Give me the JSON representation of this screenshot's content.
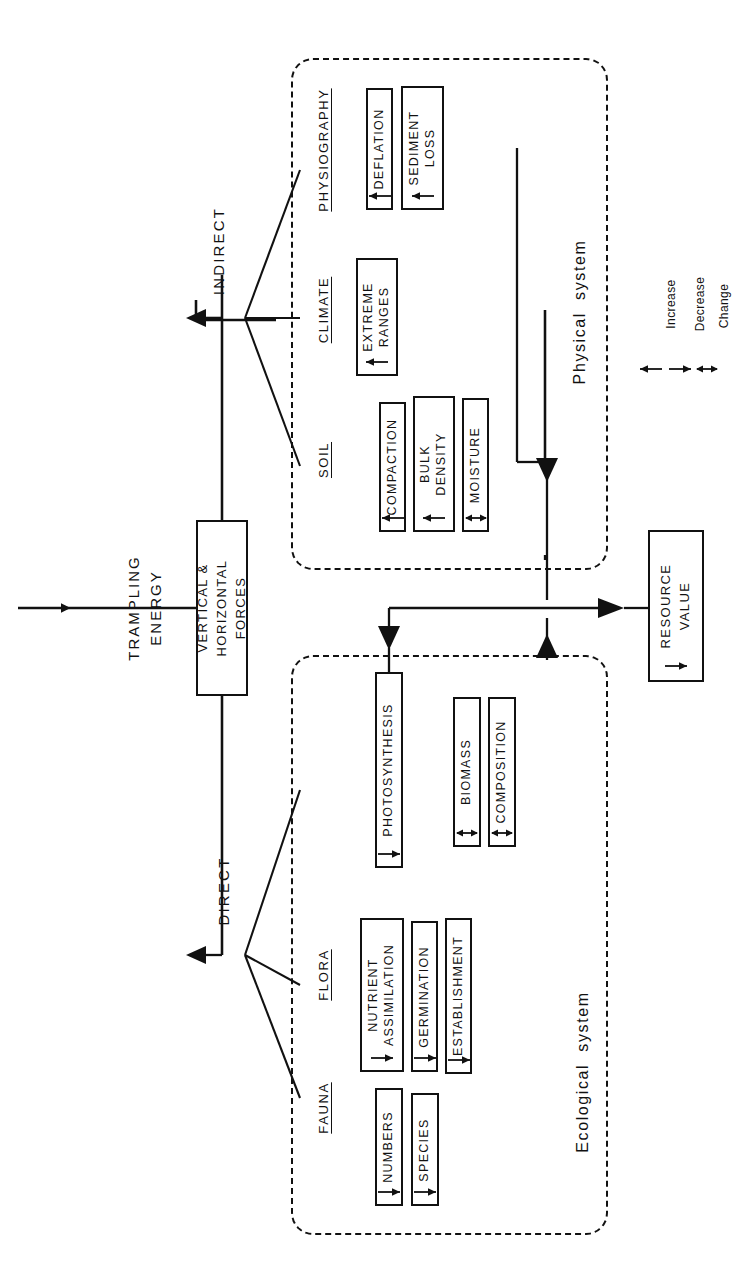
{
  "diagram": {
    "orientation": "rotated-90-ccw",
    "title": "TRAMPLING\nENERGY",
    "input_arrow": "input-arrow",
    "driver_box": {
      "label": "VERTICAL &\nHORIZONTAL\nFORCES"
    },
    "outcome_box": {
      "label": "RESOURCE\nVALUE",
      "effect": "decrease"
    },
    "branches": [
      {
        "name": "INDIRECT"
      },
      {
        "name": "DIRECT"
      }
    ],
    "systems": [
      {
        "id": "physical",
        "label": "Physical  system"
      },
      {
        "id": "ecological",
        "label": "Ecological  system"
      }
    ],
    "categories": [
      {
        "id": "soil",
        "label": "SOIL"
      },
      {
        "id": "climate",
        "label": "CLIMATE"
      },
      {
        "id": "physiography",
        "label": "PHYSIOGRAPHY"
      },
      {
        "id": "fauna",
        "label": "FAUNA"
      },
      {
        "id": "flora",
        "label": "FLORA"
      }
    ],
    "variables": [
      {
        "id": "compaction",
        "label": "COMPACTION",
        "category": "soil",
        "system": "physical",
        "effect": "increase"
      },
      {
        "id": "bulk-density",
        "label": "BULK\nDENSITY",
        "category": "soil",
        "system": "physical",
        "effect": "increase"
      },
      {
        "id": "moisture",
        "label": "MOISTURE",
        "category": "soil",
        "system": "physical",
        "effect": "change"
      },
      {
        "id": "extreme-ranges",
        "label": "EXTREME\nRANGES",
        "category": "climate",
        "system": "physical",
        "effect": "increase"
      },
      {
        "id": "deflation",
        "label": "DEFLATION",
        "category": "physiography",
        "system": "physical",
        "effect": "increase"
      },
      {
        "id": "sediment-loss",
        "label": "SEDIMENT\nLOSS",
        "category": "physiography",
        "system": "physical",
        "effect": "increase"
      },
      {
        "id": "numbers",
        "label": "NUMBERS",
        "category": "fauna",
        "system": "ecological",
        "effect": "decrease"
      },
      {
        "id": "species",
        "label": "SPECIES",
        "category": "fauna",
        "system": "ecological",
        "effect": "decrease"
      },
      {
        "id": "nutrient-assimilation",
        "label": "NUTRIENT\nASSIMILATION",
        "category": "flora",
        "system": "ecological",
        "effect": "decrease"
      },
      {
        "id": "germination",
        "label": "GERMINATION",
        "category": "flora",
        "system": "ecological",
        "effect": "decrease"
      },
      {
        "id": "establishment",
        "label": "ESTABLISHMENT",
        "category": "flora",
        "system": "ecological",
        "effect": "decrease"
      },
      {
        "id": "photosynthesis",
        "label": "PHOTOSYNTHESIS",
        "category": "flora",
        "system": "ecological",
        "effect": "decrease"
      },
      {
        "id": "biomass",
        "label": "BIOMASS",
        "category": "flora",
        "system": "ecological",
        "effect": "change"
      },
      {
        "id": "composition",
        "label": "COMPOSITION",
        "category": "flora",
        "system": "ecological",
        "effect": "change"
      }
    ],
    "legend": {
      "items": [
        {
          "symbol": "increase",
          "label": "Increase"
        },
        {
          "symbol": "decrease",
          "label": "Decrease"
        },
        {
          "symbol": "change",
          "label": "Change"
        }
      ]
    },
    "colors": {
      "ink": "#111111",
      "background": "#ffffff"
    }
  }
}
